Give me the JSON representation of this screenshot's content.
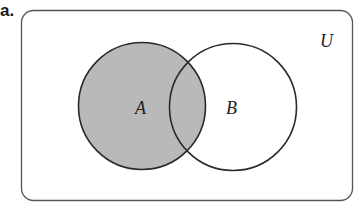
{
  "figure": {
    "part_label": "a.",
    "universe_label": "U",
    "sets": [
      {
        "name": "A",
        "shaded": true
      },
      {
        "name": "B",
        "shaded": false
      }
    ],
    "shaded_region": "A",
    "colors": {
      "shade": "#b9b9b9",
      "stroke": "#2a2a2a",
      "frame": "#555555",
      "background": "#ffffff"
    }
  }
}
